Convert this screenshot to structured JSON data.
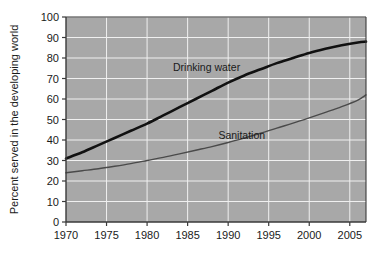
{
  "chart_data": {
    "type": "line",
    "title": "",
    "xlabel": "",
    "ylabel": "Percent served in the developing world",
    "xlim": [
      1970,
      2007
    ],
    "ylim": [
      0,
      100
    ],
    "grid": true,
    "legend_position": "inline-annotations",
    "background_color": "#a8a8a8",
    "gridline_color": "#f0f0f0",
    "axis_color": "#3a3a3a",
    "xticks": [
      "1970",
      "1975",
      "1980",
      "1985",
      "1990",
      "1995",
      "2000",
      "2005"
    ],
    "xtick_values": [
      1970,
      1975,
      1980,
      1985,
      1990,
      1995,
      2000,
      2005
    ],
    "yticks": [
      "0",
      "10",
      "20",
      "30",
      "40",
      "50",
      "60",
      "70",
      "80",
      "90",
      "100"
    ],
    "ytick_values": [
      0,
      10,
      20,
      30,
      40,
      50,
      60,
      70,
      80,
      90,
      100
    ],
    "x": [
      1970,
      1972,
      1974,
      1976,
      1978,
      1980,
      1982,
      1984,
      1986,
      1988,
      1990,
      1992,
      1994,
      1996,
      1998,
      2000,
      2002,
      2004,
      2006,
      2007
    ],
    "series": [
      {
        "name": "Drinking water",
        "color": "#111111",
        "width": 2.6,
        "label_x": 1983.2,
        "label_y": 73.5,
        "values": [
          31,
          34,
          37.5,
          41,
          44.5,
          48,
          52,
          56,
          60,
          64,
          68,
          71.5,
          74.5,
          77.5,
          80,
          82.5,
          84.5,
          86.2,
          87.6,
          88
        ]
      },
      {
        "name": "Sanitation",
        "color": "#4a4a4a",
        "width": 1.4,
        "label_x": 1988.8,
        "label_y": 40.5,
        "values": [
          24,
          25,
          26,
          27.2,
          28.5,
          30,
          31.5,
          33.2,
          35,
          36.8,
          38.8,
          41,
          43.3,
          45.8,
          48.2,
          50.8,
          53.5,
          56.3,
          59.5,
          62
        ]
      }
    ]
  }
}
